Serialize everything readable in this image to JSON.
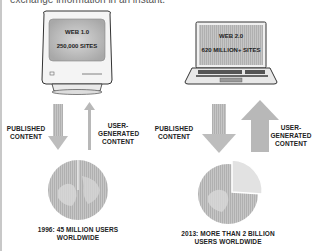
{
  "intro_text": "exchange information in an instant.",
  "web1": {
    "title": "WEB 1.0",
    "sites": "250,000 SITES",
    "published_label_line1": "PUBLISHED",
    "published_label_line2": "CONTENT",
    "user_label_line1": "USER-",
    "user_label_line2": "GENERATED",
    "user_label_line3": "CONTENT",
    "caption_line1": "1996: 45 MILLION USERS",
    "caption_line2": "WORLDWIDE",
    "device": "crt-monitor-icon"
  },
  "web2": {
    "title": "WEB 2.0",
    "sites": "620 MILLION+ SITES",
    "published_label_line1": "PUBLISHED",
    "published_label_line2": "CONTENT",
    "user_label_line1": "USER-",
    "user_label_line2": "GENERATED",
    "user_label_line3": "CONTENT",
    "caption_line1": "2013: MORE THAN 2 BILLION",
    "caption_line2": "USERS WORLDWIDE",
    "device": "laptop-icon"
  },
  "colors": {
    "arrow": "#b8b8b8",
    "screen": "#c4c4c4",
    "globe": "#bdbdbd",
    "outline": "#333333"
  }
}
